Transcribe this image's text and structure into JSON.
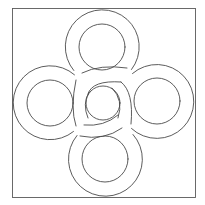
{
  "diagram": {
    "title": "Interlaced four-ring knot",
    "stroke_color": "#4a4a4a",
    "background_color": "#ffffff",
    "frame": {
      "x": 12,
      "y": 8,
      "width": 183,
      "height": 189
    },
    "center_circle": {
      "cx": 103,
      "cy": 103,
      "r": 17
    },
    "rings": [
      {
        "name": "top",
        "cx": 102,
        "cy": 47,
        "outer_r": 37,
        "inner_r": 23
      },
      {
        "name": "left",
        "cx": 50,
        "cy": 103,
        "outer_r": 37,
        "inner_r": 23
      },
      {
        "name": "right",
        "cx": 157,
        "cy": 101,
        "outer_r": 37,
        "inner_r": 23
      },
      {
        "name": "bottom",
        "cx": 105,
        "cy": 159,
        "outer_r": 37,
        "inner_r": 23
      }
    ]
  }
}
